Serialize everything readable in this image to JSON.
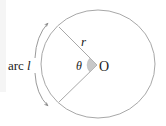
{
  "diagram": {
    "labels": {
      "arc_prefix": "arc",
      "arc_symbol": "l",
      "radius": "r",
      "angle": "θ",
      "center": "O"
    },
    "colors": {
      "stroke": "#a8a8a8",
      "text": "#222222",
      "angle_fill": "#c8c8c8",
      "background": "#ffffff"
    },
    "geometry": {
      "center": [
        97,
        65
      ],
      "radius_x": 57,
      "radius_y": 54,
      "radius_end_upper": [
        59,
        27
      ],
      "radius_end_lower": [
        59,
        102
      ]
    }
  }
}
